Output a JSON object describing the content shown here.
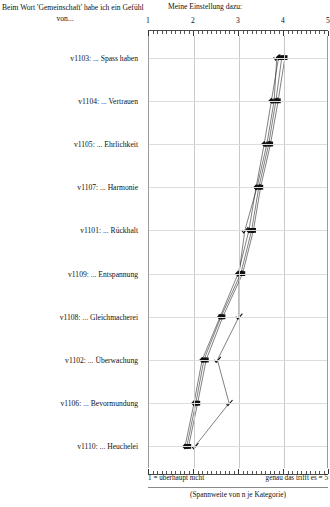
{
  "header": {
    "left_line1": "Beim Wort 'Gemeinschaft' habe ich ein Gefühl",
    "left_line2": "von...",
    "right": "Meine Einstellung dazu:"
  },
  "footer": {
    "left": "1 = überhaupt nicht",
    "right": "genau das trifft es = 5",
    "note": "(Spannweite von n je Kategorie)"
  },
  "chart_data": {
    "type": "line",
    "title": "Beim Wort 'Gemeinschaft' habe ich ein Gefühl von...",
    "subtitle": "Meine Einstellung dazu:",
    "xlabel": "",
    "ylabel": "",
    "xlim": [
      1,
      5
    ],
    "orientation": "horizontal",
    "grid": true,
    "legend": "none",
    "xticks": [
      1,
      2,
      3,
      4,
      5
    ],
    "xtick_labels": [
      "1",
      "2",
      "3",
      "4",
      "5"
    ],
    "x_min_label": "1 = überhaupt nicht",
    "x_max_label": "genau das trifft es = 5",
    "categories": [
      "v1103: ... Spass haben",
      "v1104: ... Vertrauen",
      "v1105: ... Ehrlichkeit",
      "v1107: ... Harmonie",
      "v1101: ... Rückhalt",
      "v1109: ... Entspannung",
      "v1108: ... Gleichmacherei",
      "v1102: ... Überwachung",
      "v1106: ... Bevormundung",
      "v1110: ... Heuchelei"
    ],
    "series": [
      {
        "name": "Serie A",
        "marker": "square",
        "values": [
          4.02,
          3.87,
          3.7,
          3.48,
          3.32,
          3.08,
          2.64,
          2.27,
          2.08,
          1.88
        ]
      },
      {
        "name": "Serie B",
        "marker": "square",
        "values": [
          3.95,
          3.82,
          3.66,
          3.44,
          3.28,
          3.04,
          2.6,
          2.22,
          2.04,
          1.84
        ]
      },
      {
        "name": "Serie C",
        "marker": "diamond",
        "values": [
          3.88,
          3.72,
          3.56,
          3.38,
          3.22,
          2.98,
          2.58,
          2.18,
          2.0,
          1.8
        ]
      },
      {
        "name": "Serie D",
        "marker": "check",
        "values": [
          3.84,
          3.78,
          3.62,
          3.4,
          3.13,
          3.0,
          3.0,
          2.52,
          2.78,
          2.02
        ]
      }
    ]
  }
}
